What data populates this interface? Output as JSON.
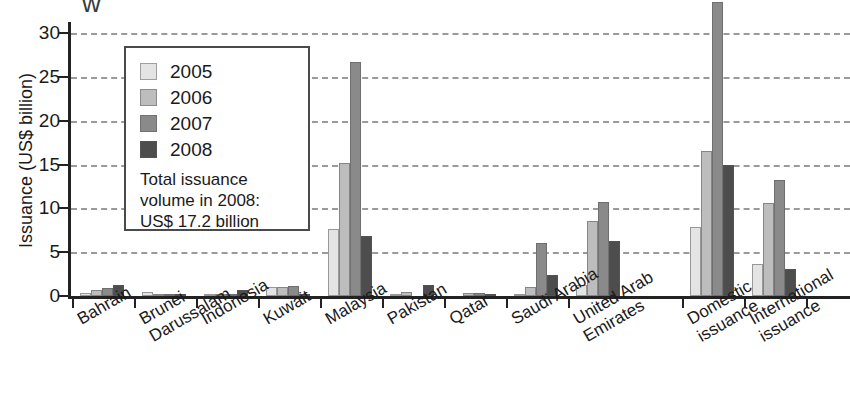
{
  "axes": {
    "ylabel": "Issuance (US$ billion)",
    "yticks": [
      "0",
      "5",
      "10",
      "15",
      "20",
      "25",
      "30"
    ]
  },
  "legend": {
    "items": [
      {
        "label": "2005",
        "color": "#e4e4e4"
      },
      {
        "label": "2006",
        "color": "#bdbdbd"
      },
      {
        "label": "2007",
        "color": "#8a8a8a"
      },
      {
        "label": "2008",
        "color": "#4d4d4d"
      }
    ],
    "note_line1": "Total issuance",
    "note_line2": "volume in 2008:",
    "note_line3": "US$ 17.2 billion"
  },
  "categories": [
    {
      "line1": "Bahrain",
      "line2": ""
    },
    {
      "line1": "Brunei",
      "line2": "Darussalam"
    },
    {
      "line1": "Indonesia",
      "line2": ""
    },
    {
      "line1": "Kuwait",
      "line2": ""
    },
    {
      "line1": "Malaysia",
      "line2": ""
    },
    {
      "line1": "Pakistan",
      "line2": ""
    },
    {
      "line1": "Qatar",
      "line2": ""
    },
    {
      "line1": "Saudi Arabia",
      "line2": ""
    },
    {
      "line1": "United Arab",
      "line2": "Emirates"
    },
    {
      "line1": "Domestic",
      "line2": "issuance"
    },
    {
      "line1": "International",
      "line2": "issuance"
    }
  ],
  "chart_data": {
    "type": "bar",
    "title": "",
    "xlabel": "",
    "ylabel": "Issuance (US$ billion)",
    "ylim": [
      0,
      30
    ],
    "grid": true,
    "legend_position": "top-left-inside",
    "categories": [
      "Bahrain",
      "Brunei Darussalam",
      "Indonesia",
      "Kuwait",
      "Malaysia",
      "Pakistan",
      "Qatar",
      "Saudi Arabia",
      "United Arab Emirates",
      "Domestic issuance",
      "International issuance"
    ],
    "series": [
      {
        "name": "2005",
        "values": [
          0.4,
          0.5,
          0.1,
          1.0,
          7.7,
          0.1,
          0.0,
          0.1,
          1.3,
          7.9,
          3.7
        ]
      },
      {
        "name": "2006",
        "values": [
          0.7,
          0.2,
          0.1,
          1.0,
          15.2,
          0.5,
          0.3,
          1.0,
          8.5,
          16.5,
          10.6
        ]
      },
      {
        "name": "2007",
        "values": [
          0.9,
          0.1,
          0.2,
          1.1,
          26.7,
          0.0,
          0.4,
          6.0,
          10.7,
          33.5,
          13.2
        ]
      },
      {
        "name": "2008",
        "values": [
          1.3,
          0.1,
          0.7,
          0.2,
          6.8,
          1.3,
          0.1,
          2.4,
          6.3,
          15.0,
          3.1
        ]
      }
    ],
    "annotations": [
      "Total issuance volume in 2008: US$ 17.2 billion"
    ]
  }
}
